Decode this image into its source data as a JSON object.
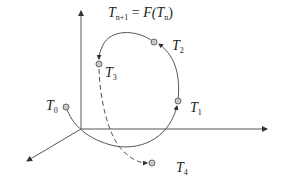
{
  "diagram": {
    "title_equation": {
      "lhs_base": "T",
      "lhs_sub": "n+1",
      "eq": " = ",
      "func": "F(",
      "rhs_base": "T",
      "rhs_sub": "n",
      "close": ")"
    },
    "axes": {
      "origin": [
        81,
        129
      ],
      "vertical_end": [
        81,
        10
      ],
      "horizontal_end": [
        268,
        129
      ],
      "diagonal_end": [
        26,
        162
      ]
    },
    "points": [
      {
        "name": "T0",
        "base": "T",
        "sub": "0",
        "x": 66,
        "y": 107,
        "label_x": 46,
        "label_y": 110
      },
      {
        "name": "T1",
        "base": "T",
        "sub": "1",
        "x": 178,
        "y": 101,
        "label_x": 190,
        "label_y": 112
      },
      {
        "name": "T2",
        "base": "T",
        "sub": "2",
        "x": 154,
        "y": 42,
        "label_x": 173,
        "label_y": 50
      },
      {
        "name": "T3",
        "base": "T",
        "sub": "3",
        "x": 99,
        "y": 64,
        "label_x": 106,
        "label_y": 76
      },
      {
        "name": "T4",
        "base": "T",
        "sub": "4",
        "x": 152,
        "y": 163,
        "label_x": 176,
        "label_y": 172
      }
    ],
    "colors": {
      "line": "#555555",
      "point_fill": "#c8c8c8",
      "point_stroke": "#666666"
    }
  }
}
